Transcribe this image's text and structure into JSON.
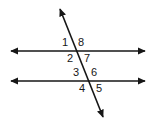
{
  "figure": {
    "kind": "geometry-diagram",
    "background_color": "#ffffff",
    "line_color": "#161616",
    "label_color": "#161616",
    "width": 156,
    "height": 128
  },
  "lines": {
    "top_parallel": {
      "name": "top-parallel-line",
      "x1": 11,
      "y1": 51,
      "x2": 145,
      "y2": 51,
      "arrow_start": true,
      "arrow_end": true
    },
    "bottom_parallel": {
      "name": "bottom-parallel-line",
      "x1": 11,
      "y1": 81,
      "x2": 145,
      "y2": 81,
      "arrow_start": true,
      "arrow_end": true
    },
    "transversal": {
      "name": "transversal-line",
      "x1": 60,
      "y1": 9,
      "x2": 103,
      "y2": 117,
      "arrow_start": true,
      "arrow_end": true
    }
  },
  "intersections": {
    "upper": {
      "x": 76,
      "y": 51
    },
    "lower": {
      "x": 88,
      "y": 81
    }
  },
  "angle_labels": [
    {
      "id": "angle-1",
      "text": "1",
      "x": 62,
      "y": 37
    },
    {
      "id": "angle-8",
      "text": "8",
      "x": 78,
      "y": 37
    },
    {
      "id": "angle-2",
      "text": "2",
      "x": 67,
      "y": 53
    },
    {
      "id": "angle-7",
      "text": "7",
      "x": 84,
      "y": 53
    },
    {
      "id": "angle-3",
      "text": "3",
      "x": 73,
      "y": 67
    },
    {
      "id": "angle-6",
      "text": "6",
      "x": 91,
      "y": 67
    },
    {
      "id": "angle-4",
      "text": "4",
      "x": 79,
      "y": 83
    },
    {
      "id": "angle-5",
      "text": "5",
      "x": 96,
      "y": 83
    }
  ]
}
